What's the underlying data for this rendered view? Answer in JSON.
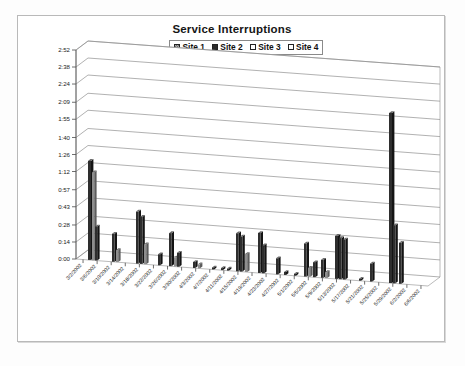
{
  "chart_title": "Service Interruptions",
  "legend": {
    "position": "top-center",
    "entries": [
      {
        "label": "Site 1",
        "swatch": "hatched-gray",
        "color": "#a8a8a8"
      },
      {
        "label": "Site 2",
        "swatch": "solid-dark",
        "color": "#2b2b2b"
      },
      {
        "label": "Site 3",
        "swatch": "white",
        "color": "#ffffff"
      },
      {
        "label": "Site 4",
        "swatch": "white",
        "color": "#ffffff"
      }
    ]
  },
  "chart_data": {
    "type": "bar",
    "title": "Service Interruptions",
    "subtitle": "",
    "xlabel": "",
    "ylabel": "",
    "grid": true,
    "three_d": true,
    "legend_position": "top-center",
    "ylim": [
      "0:00",
      "2:52"
    ],
    "ytick_labels": [
      "0:00",
      "0:14",
      "0:28",
      "0:43",
      "0:57",
      "1:12",
      "1:26",
      "1:40",
      "1:55",
      "2:09",
      "2:24",
      "2:38",
      "2:52"
    ],
    "ytick_minutes": [
      0,
      14,
      28,
      43,
      57,
      72,
      86,
      100,
      115,
      129,
      144,
      158,
      172
    ],
    "categories": [
      "3/2/2002",
      "3/6/2002",
      "3/10/2002",
      "3/14/2002",
      "3/18/2002",
      "3/22/2002",
      "3/26/2002",
      "3/30/2002",
      "4/3/2002",
      "4/7/2002",
      "4/11/2002",
      "4/15/2002",
      "4/19/2002",
      "4/23/2002",
      "4/27/2002",
      "5/1/2002",
      "5/5/2002",
      "5/9/2002",
      "5/13/2002",
      "5/17/2002",
      "5/21/2002",
      "5/25/2002",
      "5/29/2002",
      "6/2/2002",
      "6/6/2002"
    ],
    "value_unit": "minutes",
    "series": [
      {
        "name": "Site 1",
        "color": "#a8a8a8",
        "values": [
          2,
          0,
          0,
          0,
          0,
          0,
          0,
          0,
          0,
          0,
          0,
          0,
          0,
          0,
          0,
          0,
          0,
          0,
          0,
          0,
          0,
          0,
          0,
          0,
          0
        ]
      },
      {
        "name": "Site 2",
        "color": "#2b2b2b",
        "values": [
          78,
          20,
          32,
          8,
          12,
          51,
          16,
          0,
          0,
          0,
          2,
          0,
          30,
          33,
          0,
          0,
          10,
          17,
          4,
          36,
          0,
          0,
          1,
          137,
          25
        ]
      },
      {
        "name": "Site 3",
        "color": "#ffffff",
        "values": [
          24,
          9,
          14,
          0,
          6,
          22,
          30,
          0,
          0,
          1,
          0,
          26,
          14,
          0,
          0,
          6,
          21,
          9,
          0,
          32,
          0,
          0,
          0,
          47,
          18
        ]
      },
      {
        "name": "Site 4",
        "color": "#ffffff",
        "values": [
          11,
          0,
          5,
          0,
          0,
          8,
          0,
          0,
          0,
          0,
          0,
          3,
          0,
          0,
          0,
          0,
          6,
          0,
          0,
          14,
          0,
          0,
          0,
          20,
          0
        ]
      }
    ]
  },
  "bars_px": [
    {
      "x": 70,
      "h": 99,
      "w": 3.0,
      "shade": "dark"
    },
    {
      "x": 74,
      "h": 88,
      "w": 2.2,
      "shade": "mid"
    },
    {
      "x": 77,
      "h": 34,
      "w": 2.2,
      "shade": "dark"
    },
    {
      "x": 94,
      "h": 28,
      "w": 2.6,
      "shade": "dark"
    },
    {
      "x": 98,
      "h": 12,
      "w": 2.2,
      "shade": "mid"
    },
    {
      "x": 118,
      "h": 52,
      "w": 2.6,
      "shade": "dark"
    },
    {
      "x": 122,
      "h": 47,
      "w": 2.4,
      "shade": "dark"
    },
    {
      "x": 126,
      "h": 20,
      "w": 2.2,
      "shade": "mid"
    },
    {
      "x": 140,
      "h": 11,
      "w": 2.2,
      "shade": "dark"
    },
    {
      "x": 151,
      "h": 33,
      "w": 2.6,
      "shade": "dark"
    },
    {
      "x": 156,
      "h": 9,
      "w": 2.2,
      "shade": "mid"
    },
    {
      "x": 159,
      "h": 14,
      "w": 2.2,
      "shade": "dark"
    },
    {
      "x": 175,
      "h": 6,
      "w": 2.2,
      "shade": "dark"
    },
    {
      "x": 180,
      "h": 4,
      "w": 2.0,
      "shade": "mid"
    },
    {
      "x": 194,
      "h": 2,
      "w": 2.0,
      "shade": "dark"
    },
    {
      "x": 203,
      "h": 2,
      "w": 2.0,
      "shade": "dark"
    },
    {
      "x": 209,
      "h": 2,
      "w": 2.0,
      "shade": "dark"
    },
    {
      "x": 218,
      "h": 38,
      "w": 2.6,
      "shade": "dark"
    },
    {
      "x": 222,
      "h": 35,
      "w": 2.4,
      "shade": "dark"
    },
    {
      "x": 227,
      "h": 18,
      "w": 2.2,
      "shade": "mid"
    },
    {
      "x": 240,
      "h": 40,
      "w": 2.6,
      "shade": "dark"
    },
    {
      "x": 244,
      "h": 28,
      "w": 2.2,
      "shade": "dark"
    },
    {
      "x": 258,
      "h": 16,
      "w": 2.2,
      "shade": "dark"
    },
    {
      "x": 266,
      "h": 3,
      "w": 2.0,
      "shade": "dark"
    },
    {
      "x": 276,
      "h": 2,
      "w": 2.0,
      "shade": "dark"
    },
    {
      "x": 286,
      "h": 33,
      "w": 2.6,
      "shade": "dark"
    },
    {
      "x": 290,
      "h": 9,
      "w": 2.2,
      "shade": "mid"
    },
    {
      "x": 295,
      "h": 15,
      "w": 2.2,
      "shade": "dark"
    },
    {
      "x": 303,
      "h": 18,
      "w": 2.6,
      "shade": "dark"
    },
    {
      "x": 307,
      "h": 6,
      "w": 2.2,
      "shade": "mid"
    },
    {
      "x": 317,
      "h": 43,
      "w": 3.0,
      "shade": "dark"
    },
    {
      "x": 321,
      "h": 41,
      "w": 2.6,
      "shade": "dark"
    },
    {
      "x": 325,
      "h": 40,
      "w": 2.4,
      "shade": "dark"
    },
    {
      "x": 341,
      "h": 2,
      "w": 2.0,
      "shade": "dark"
    },
    {
      "x": 352,
      "h": 18,
      "w": 2.2,
      "shade": "dark"
    },
    {
      "x": 371,
      "h": 170,
      "w": 3.0,
      "shade": "dark"
    },
    {
      "x": 375,
      "h": 58,
      "w": 2.4,
      "shade": "dark"
    },
    {
      "x": 381,
      "h": 41,
      "w": 2.4,
      "shade": "dark"
    }
  ]
}
